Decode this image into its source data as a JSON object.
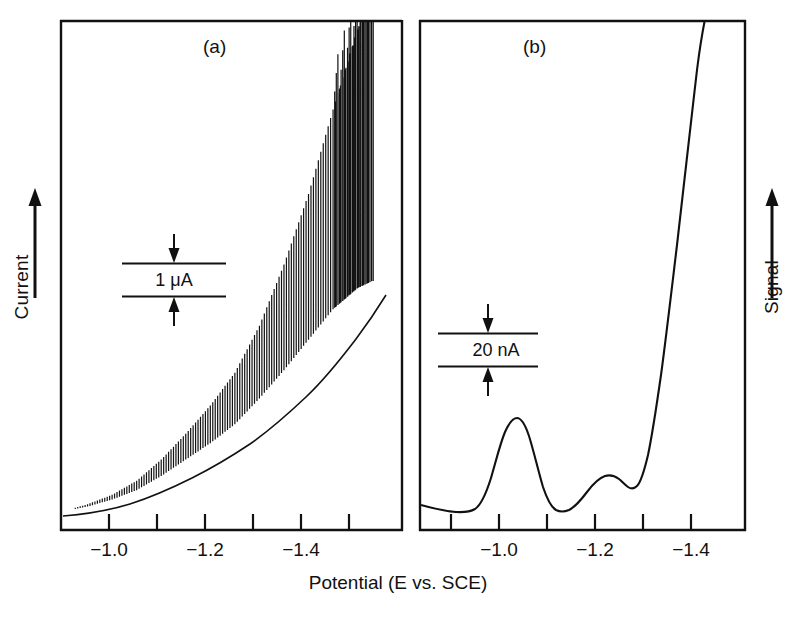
{
  "figure": {
    "axis_titles": {
      "left": "Current",
      "right": "Signal",
      "bottom": "Potential (E vs. SCE)"
    },
    "panels": [
      {
        "letter": "(a)",
        "scalebar_label": "1 μA",
        "tick_labels": [
          "−1.0",
          "−1.2",
          "−1.4"
        ]
      },
      {
        "letter": "(b)",
        "scalebar_label": "20 nA",
        "tick_labels": [
          "−1.0",
          "−1.2",
          "−1.4"
        ]
      }
    ]
  },
  "chart_data": {
    "type": "line",
    "title": "",
    "subtitle": "",
    "xlabel": "Potential (E vs. SCE)",
    "ylabel": "Current",
    "ylabel_right": "Signal",
    "grid": false,
    "legend": "none",
    "panels": [
      {
        "id": "a",
        "label": "(a)",
        "ylabel": "Current",
        "scalebar": {
          "value": 1,
          "unit": "μA",
          "text": "1 μA"
        },
        "xlim": [
          -0.85,
          -1.52
        ],
        "xticks_major": [
          -1.0,
          -1.2,
          -1.4
        ],
        "xticks_minor": [
          -0.9,
          -1.1,
          -1.3,
          -1.5
        ],
        "xticklabels": [
          "−1.0",
          "−1.2",
          "−1.4"
        ],
        "description": "Staircase/square-wave voltammogram: rising envelope with high-frequency oscillation spikes whose amplitude grows toward negative potential, running off the top of the frame near -1.45 V.",
        "series": [
          {
            "name": "baseline envelope",
            "x": [
              -0.85,
              -0.9,
              -0.95,
              -1.0,
              -1.05,
              -1.1,
              -1.15,
              -1.2,
              -1.25,
              -1.3,
              -1.35,
              -1.4,
              -1.45,
              -1.48
            ],
            "y": [
              0.02,
              0.04,
              0.07,
              0.11,
              0.17,
              0.24,
              0.31,
              0.39,
              0.5,
              0.62,
              0.75,
              0.88,
              0.97,
              1.0
            ]
          },
          {
            "name": "oscillation amplitude",
            "x": [
              -0.85,
              -0.9,
              -0.95,
              -1.0,
              -1.05,
              -1.1,
              -1.15,
              -1.2,
              -1.25,
              -1.3,
              -1.35,
              -1.4,
              -1.45,
              -1.48
            ],
            "y": [
              0.0,
              0.01,
              0.02,
              0.04,
              0.07,
              0.11,
              0.16,
              0.22,
              0.31,
              0.45,
              0.62,
              0.85,
              1.1,
              1.25
            ]
          }
        ]
      },
      {
        "id": "b",
        "label": "(b)",
        "ylabel": "Signal",
        "scalebar": {
          "value": 20,
          "unit": "nA",
          "text": "20 nA"
        },
        "xlim": [
          -0.85,
          -1.52
        ],
        "xticks_major": [
          -1.0,
          -1.2,
          -1.4
        ],
        "xticks_minor": [
          -0.9,
          -1.1,
          -1.3,
          -1.5
        ],
        "xticklabels": [
          "−1.0",
          "−1.2",
          "−1.4"
        ],
        "description": "Smoothed/derivative trace: flat baseline, a sharp peak near -1.00 V, a minimum near -1.10 V, a small shoulder peak near -1.20 V, then a steep rise off the top of the frame beyond -1.28 V.",
        "peaks": [
          {
            "position": -1.0,
            "relative_height": 0.62,
            "kind": "main"
          },
          {
            "position": -1.2,
            "relative_height": 0.22,
            "kind": "shoulder"
          }
        ],
        "series": [
          {
            "name": "signal",
            "x": [
              -0.85,
              -0.9,
              -0.94,
              -0.97,
              -1.0,
              -1.03,
              -1.06,
              -1.09,
              -1.12,
              -1.16,
              -1.2,
              -1.23,
              -1.26,
              -1.29,
              -1.32,
              -1.36
            ],
            "y": [
              0.07,
              0.04,
              0.06,
              0.3,
              0.62,
              0.38,
              0.12,
              0.02,
              0.05,
              0.16,
              0.22,
              0.17,
              0.3,
              0.7,
              1.1,
              1.45
            ]
          }
        ]
      }
    ]
  }
}
